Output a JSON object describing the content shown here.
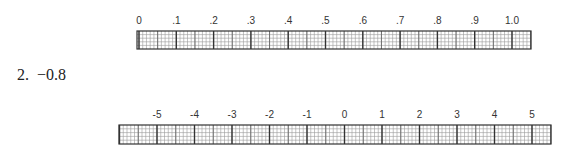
{
  "problem": {
    "number": "2.",
    "value": "−0.8"
  },
  "rulers": [
    {
      "name": "decimal-number-line",
      "labels": [
        "0",
        ".1",
        ".2",
        ".3",
        ".4",
        ".5",
        ".6",
        ".7",
        ".8",
        ".9",
        "1.0"
      ],
      "minor_divisions": 10,
      "rows": 5
    },
    {
      "name": "integer-number-line",
      "labels": [
        "-5",
        "-4",
        "-3",
        "-2",
        "-1",
        "0",
        "1",
        "2",
        "3",
        "4",
        "5"
      ],
      "minor_divisions": 10,
      "rows": 5
    }
  ]
}
